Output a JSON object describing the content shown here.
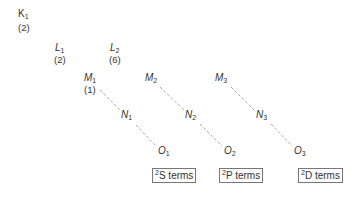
{
  "shells": {
    "K1": {
      "letter": "K",
      "sub": "1",
      "count": "(2)"
    },
    "L1": {
      "letter": "L",
      "sub": "1",
      "count": "(2)"
    },
    "L2": {
      "letter": "L",
      "sub": "2",
      "count": "(6)"
    },
    "M1": {
      "letter": "M",
      "sub": "1",
      "count": "(1)"
    },
    "M2": {
      "letter": "M",
      "sub": "2"
    },
    "M3": {
      "letter": "M",
      "sub": "3"
    },
    "N1": {
      "letter": "N",
      "sub": "1"
    },
    "N2": {
      "letter": "N",
      "sub": "2"
    },
    "N3": {
      "letter": "N",
      "sub": "3"
    },
    "O1": {
      "letter": "O",
      "sub": "1"
    },
    "O2": {
      "letter": "O",
      "sub": "2"
    },
    "O3": {
      "letter": "O",
      "sub": "3"
    }
  },
  "series": [
    {
      "sup": "2",
      "label": "S terms"
    },
    {
      "sup": "2",
      "label": "P terms"
    },
    {
      "sup": "2",
      "label": "D terms"
    }
  ],
  "colors": {
    "line": "#aaaaaa",
    "text": "#333333",
    "box_border": "#777777"
  }
}
